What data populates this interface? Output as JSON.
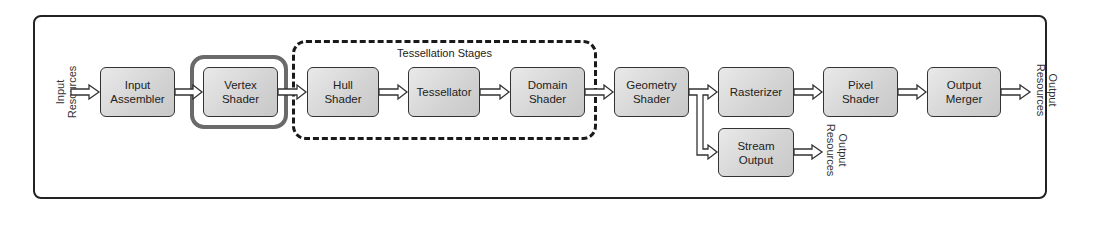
{
  "diagram": {
    "input_label": [
      "Input",
      "Resources"
    ],
    "output_label": [
      "Output",
      "Resources"
    ],
    "stream_output_label": [
      "Output",
      "Resources"
    ],
    "tessellation_group_label": "Tessellation Stages",
    "highlighted_stage": "Vertex Shader",
    "stages": [
      {
        "id": "input-assembler",
        "line1": "Input",
        "line2": "Assembler"
      },
      {
        "id": "vertex-shader",
        "line1": "Vertex",
        "line2": "Shader"
      },
      {
        "id": "hull-shader",
        "line1": "Hull",
        "line2": "Shader"
      },
      {
        "id": "tessellator",
        "line1": "Tessellator",
        "line2": ""
      },
      {
        "id": "domain-shader",
        "line1": "Domain",
        "line2": "Shader"
      },
      {
        "id": "geometry-shader",
        "line1": "Geometry",
        "line2": "Shader"
      },
      {
        "id": "rasterizer",
        "line1": "Rasterizer",
        "line2": ""
      },
      {
        "id": "pixel-shader",
        "line1": "Pixel",
        "line2": "Shader"
      },
      {
        "id": "output-merger",
        "line1": "Output",
        "line2": "Merger"
      },
      {
        "id": "stream-output",
        "line1": "Stream",
        "line2": "Output"
      }
    ],
    "edges": [
      [
        "Input Resources",
        "Input Assembler"
      ],
      [
        "Input Assembler",
        "Vertex Shader"
      ],
      [
        "Vertex Shader",
        "Hull Shader"
      ],
      [
        "Hull Shader",
        "Tessellator"
      ],
      [
        "Tessellator",
        "Domain Shader"
      ],
      [
        "Domain Shader",
        "Geometry Shader"
      ],
      [
        "Geometry Shader",
        "Rasterizer"
      ],
      [
        "Geometry Shader",
        "Stream Output"
      ],
      [
        "Rasterizer",
        "Pixel Shader"
      ],
      [
        "Pixel Shader",
        "Output Merger"
      ],
      [
        "Output Merger",
        "Output Resources"
      ],
      [
        "Stream Output",
        "Output Resources"
      ]
    ],
    "colors": {
      "stage_fill_light": "#e9e9e9",
      "stage_fill_dark": "#c8c8c8",
      "stage_border": "#333333",
      "highlight_outline": "#6a6a6a",
      "frame_border": "#222222"
    }
  }
}
